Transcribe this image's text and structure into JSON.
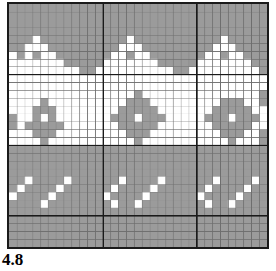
{
  "figure": {
    "label": "4.8",
    "caption_text": "4.8"
  },
  "chart_data": {
    "type": "heatmap",
    "title": "4.8",
    "subtitle": "",
    "xlabel": "",
    "ylabel": "",
    "grid": true,
    "legend_position": "none",
    "cols": 33,
    "rows": 31,
    "cell_px": 7.9,
    "major_gridline_cols": [
      0,
      12,
      24,
      33
    ],
    "major_gridline_rows": [
      0,
      9,
      18,
      27,
      31
    ],
    "colors": {
      "background_cell": "#ffffff",
      "contrast_cell": "#9b9b9b",
      "minor_gridline": "#6e6e6e",
      "major_gridline": "#1a1a1a",
      "border": "#1a1a1a",
      "label_text": "#000000"
    },
    "value_legend": [
      {
        "value": 0,
        "name": "background-stitch",
        "color": "#ffffff"
      },
      {
        "value": 1,
        "name": "contrast-stitch",
        "color": "#9b9b9b"
      }
    ],
    "matrix": [
      [
        1,
        1,
        1,
        1,
        1,
        1,
        1,
        1,
        1,
        1,
        1,
        1,
        1,
        1,
        1,
        1,
        1,
        1,
        1,
        1,
        1,
        1,
        1,
        1,
        1,
        1,
        1,
        1,
        1,
        1,
        1,
        1,
        1
      ],
      [
        1,
        1,
        1,
        1,
        1,
        1,
        1,
        1,
        1,
        1,
        1,
        1,
        1,
        1,
        1,
        1,
        1,
        1,
        1,
        1,
        1,
        1,
        1,
        1,
        1,
        1,
        1,
        1,
        1,
        1,
        1,
        1,
        1
      ],
      [
        1,
        1,
        1,
        1,
        1,
        1,
        1,
        1,
        1,
        1,
        1,
        1,
        1,
        1,
        1,
        1,
        1,
        1,
        1,
        1,
        1,
        1,
        1,
        1,
        1,
        1,
        1,
        1,
        1,
        1,
        1,
        1,
        1
      ],
      [
        1,
        1,
        1,
        1,
        1,
        1,
        1,
        1,
        1,
        1,
        1,
        1,
        1,
        1,
        1,
        1,
        1,
        1,
        1,
        1,
        1,
        1,
        1,
        1,
        1,
        1,
        1,
        1,
        1,
        1,
        1,
        1,
        1
      ],
      [
        1,
        1,
        1,
        0,
        1,
        1,
        1,
        1,
        1,
        1,
        1,
        1,
        1,
        1,
        1,
        0,
        1,
        1,
        1,
        1,
        1,
        1,
        1,
        1,
        1,
        1,
        1,
        0,
        1,
        1,
        1,
        1,
        1
      ],
      [
        1,
        1,
        0,
        0,
        0,
        1,
        1,
        1,
        1,
        1,
        1,
        1,
        1,
        1,
        0,
        0,
        0,
        1,
        1,
        1,
        1,
        1,
        1,
        1,
        1,
        1,
        0,
        0,
        0,
        1,
        1,
        1,
        1
      ],
      [
        0,
        1,
        0,
        1,
        0,
        0,
        1,
        1,
        1,
        1,
        1,
        1,
        1,
        0,
        0,
        1,
        0,
        0,
        1,
        1,
        1,
        1,
        1,
        1,
        1,
        0,
        0,
        1,
        0,
        0,
        1,
        1,
        1
      ],
      [
        0,
        0,
        0,
        0,
        0,
        0,
        0,
        1,
        1,
        1,
        1,
        1,
        0,
        0,
        0,
        0,
        0,
        0,
        0,
        1,
        1,
        1,
        1,
        1,
        0,
        0,
        0,
        0,
        0,
        0,
        0,
        1,
        1
      ],
      [
        0,
        0,
        0,
        0,
        0,
        0,
        0,
        0,
        0,
        1,
        1,
        0,
        0,
        0,
        0,
        0,
        0,
        0,
        0,
        0,
        0,
        1,
        1,
        0,
        0,
        0,
        0,
        0,
        0,
        0,
        0,
        0,
        1
      ],
      [
        0,
        0,
        0,
        0,
        0,
        0,
        0,
        0,
        0,
        0,
        0,
        0,
        0,
        0,
        0,
        0,
        0,
        0,
        0,
        0,
        0,
        0,
        0,
        0,
        0,
        0,
        0,
        0,
        0,
        0,
        0,
        0,
        0
      ],
      [
        0,
        0,
        0,
        0,
        0,
        0,
        0,
        0,
        0,
        0,
        0,
        0,
        0,
        0,
        0,
        0,
        0,
        0,
        0,
        0,
        0,
        0,
        0,
        0,
        0,
        0,
        0,
        0,
        0,
        0,
        0,
        0,
        0
      ],
      [
        0,
        0,
        0,
        0,
        0,
        0,
        0,
        0,
        0,
        0,
        0,
        0,
        0,
        0,
        0,
        0,
        1,
        0,
        0,
        0,
        0,
        0,
        0,
        0,
        0,
        0,
        0,
        0,
        0,
        0,
        0,
        0,
        1
      ],
      [
        0,
        0,
        0,
        0,
        1,
        0,
        0,
        0,
        0,
        0,
        0,
        0,
        0,
        0,
        0,
        1,
        1,
        1,
        0,
        0,
        0,
        0,
        0,
        0,
        0,
        0,
        0,
        1,
        1,
        1,
        0,
        0,
        1
      ],
      [
        0,
        0,
        0,
        1,
        1,
        1,
        0,
        0,
        0,
        0,
        0,
        0,
        0,
        0,
        1,
        1,
        1,
        1,
        1,
        0,
        0,
        0,
        0,
        0,
        0,
        0,
        1,
        1,
        1,
        1,
        1,
        0,
        0
      ],
      [
        1,
        0,
        0,
        1,
        0,
        1,
        0,
        0,
        0,
        0,
        0,
        0,
        0,
        1,
        1,
        1,
        0,
        1,
        1,
        1,
        0,
        0,
        0,
        0,
        0,
        1,
        1,
        1,
        0,
        1,
        1,
        1,
        0
      ],
      [
        1,
        0,
        1,
        1,
        1,
        1,
        1,
        0,
        0,
        0,
        0,
        0,
        0,
        0,
        1,
        1,
        1,
        1,
        1,
        0,
        0,
        0,
        0,
        0,
        0,
        0,
        1,
        1,
        1,
        1,
        1,
        0,
        0
      ],
      [
        0,
        0,
        0,
        1,
        1,
        1,
        0,
        0,
        0,
        0,
        0,
        0,
        0,
        0,
        0,
        1,
        1,
        1,
        0,
        0,
        0,
        0,
        0,
        0,
        0,
        0,
        0,
        1,
        1,
        1,
        0,
        0,
        1
      ],
      [
        0,
        0,
        0,
        0,
        1,
        0,
        0,
        0,
        0,
        0,
        0,
        0,
        0,
        0,
        0,
        0,
        1,
        0,
        0,
        0,
        0,
        0,
        0,
        0,
        0,
        0,
        0,
        0,
        1,
        0,
        0,
        0,
        1
      ],
      [
        1,
        1,
        1,
        1,
        1,
        1,
        1,
        1,
        1,
        1,
        1,
        1,
        1,
        1,
        1,
        1,
        1,
        1,
        1,
        1,
        1,
        1,
        1,
        1,
        1,
        1,
        1,
        1,
        1,
        1,
        1,
        1,
        1
      ],
      [
        1,
        1,
        1,
        1,
        1,
        1,
        1,
        1,
        1,
        1,
        1,
        1,
        1,
        1,
        1,
        1,
        1,
        1,
        1,
        1,
        1,
        1,
        1,
        1,
        1,
        1,
        1,
        1,
        1,
        1,
        1,
        1,
        1
      ],
      [
        1,
        1,
        1,
        1,
        1,
        1,
        1,
        1,
        1,
        1,
        1,
        1,
        1,
        1,
        1,
        1,
        1,
        1,
        1,
        1,
        1,
        1,
        1,
        1,
        1,
        1,
        1,
        1,
        1,
        1,
        1,
        1,
        1
      ],
      [
        1,
        1,
        1,
        1,
        1,
        1,
        1,
        1,
        1,
        1,
        1,
        1,
        1,
        1,
        1,
        1,
        1,
        1,
        1,
        1,
        1,
        1,
        1,
        1,
        1,
        1,
        1,
        1,
        1,
        1,
        1,
        1,
        1
      ],
      [
        1,
        1,
        0,
        1,
        1,
        1,
        1,
        0,
        1,
        1,
        1,
        1,
        1,
        1,
        0,
        1,
        1,
        1,
        1,
        0,
        1,
        1,
        1,
        1,
        1,
        1,
        0,
        1,
        1,
        1,
        1,
        0,
        1
      ],
      [
        1,
        0,
        1,
        1,
        1,
        1,
        0,
        1,
        1,
        1,
        1,
        1,
        1,
        0,
        1,
        1,
        1,
        1,
        0,
        1,
        1,
        1,
        1,
        1,
        1,
        0,
        1,
        1,
        1,
        1,
        0,
        1,
        1
      ],
      [
        0,
        1,
        1,
        1,
        1,
        0,
        1,
        1,
        1,
        1,
        1,
        1,
        0,
        1,
        1,
        1,
        1,
        0,
        1,
        1,
        1,
        1,
        1,
        1,
        0,
        1,
        1,
        1,
        1,
        0,
        1,
        1,
        1
      ],
      [
        1,
        1,
        1,
        1,
        0,
        1,
        1,
        1,
        1,
        1,
        1,
        1,
        1,
        0,
        1,
        1,
        0,
        1,
        1,
        1,
        1,
        1,
        1,
        1,
        1,
        0,
        1,
        1,
        0,
        1,
        1,
        1,
        1
      ],
      [
        1,
        1,
        1,
        1,
        1,
        1,
        1,
        1,
        1,
        1,
        1,
        1,
        1,
        1,
        1,
        1,
        1,
        1,
        1,
        1,
        1,
        1,
        1,
        1,
        1,
        1,
        1,
        1,
        1,
        1,
        1,
        1,
        1
      ],
      [
        1,
        1,
        1,
        1,
        1,
        1,
        1,
        1,
        1,
        1,
        1,
        1,
        1,
        1,
        1,
        1,
        1,
        1,
        1,
        1,
        1,
        1,
        1,
        1,
        1,
        1,
        1,
        1,
        1,
        1,
        1,
        1,
        1
      ],
      [
        1,
        1,
        1,
        1,
        1,
        1,
        1,
        1,
        1,
        1,
        1,
        1,
        1,
        1,
        1,
        1,
        1,
        1,
        1,
        1,
        1,
        1,
        1,
        1,
        1,
        1,
        1,
        1,
        1,
        1,
        1,
        1,
        1
      ],
      [
        1,
        1,
        1,
        1,
        1,
        1,
        1,
        1,
        1,
        1,
        1,
        1,
        1,
        1,
        1,
        1,
        1,
        1,
        1,
        1,
        1,
        1,
        1,
        1,
        1,
        1,
        1,
        1,
        1,
        1,
        1,
        1,
        1
      ],
      [
        1,
        1,
        1,
        1,
        1,
        1,
        1,
        1,
        1,
        1,
        1,
        1,
        1,
        1,
        1,
        1,
        1,
        1,
        1,
        1,
        1,
        1,
        1,
        1,
        1,
        1,
        1,
        1,
        1,
        1,
        1,
        1,
        1
      ]
    ]
  }
}
